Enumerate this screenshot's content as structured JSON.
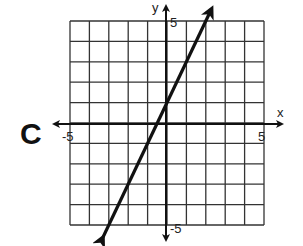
{
  "panel_label": "C",
  "chart_data": {
    "type": "line",
    "title": "",
    "xlabel": "x",
    "ylabel": "y",
    "xlim": [
      -5,
      5
    ],
    "ylim": [
      -5,
      5
    ],
    "grid": true,
    "tick_labels": {
      "x_min": "-5",
      "x_max": "5",
      "y_min": "-5",
      "y_max": "5"
    },
    "series": [
      {
        "name": "line",
        "equation": "y = 2x + 1",
        "slope": 2,
        "intercept": 1,
        "x": [
          -3.3,
          2.3
        ],
        "y": [
          -5.6,
          5.6
        ],
        "arrows_both_ends": true
      }
    ]
  }
}
